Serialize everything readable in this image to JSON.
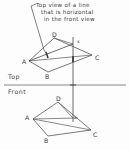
{
  "figure": {
    "title_annotation": {
      "lines": [
        "Top view of a line",
        "that is horizontal",
        "in the front view"
      ]
    },
    "view_labels": {
      "top": "Top",
      "front": "Front"
    },
    "top_view": {
      "vertices": [
        {
          "label": "A",
          "x": 29,
          "y": 61
        },
        {
          "label": "B",
          "x": 48,
          "y": 72
        },
        {
          "label": "C",
          "x": 92,
          "y": 55
        },
        {
          "label": "D",
          "x": 54,
          "y": 38
        }
      ],
      "point_x": {
        "label": "x",
        "x": 76,
        "y": 43
      },
      "horizontal_line_tick": {
        "x": 47,
        "y": 56
      }
    },
    "front_view": {
      "vertices": [
        {
          "label": "A",
          "x": 33,
          "y": 119
        },
        {
          "label": "B",
          "x": 48,
          "y": 136
        },
        {
          "label": "C",
          "x": 91,
          "y": 130
        },
        {
          "label": "D",
          "x": 58,
          "y": 102
        }
      ],
      "point_x": {
        "label": "x",
        "x": 74,
        "y": 118
      }
    },
    "fold_line": {
      "y": 85,
      "x_start": 4,
      "x_end": 126
    },
    "projector": {
      "x": 73,
      "y_top": 37,
      "y_bottom": 122
    },
    "colors": {
      "ink": "#3a3a3a",
      "line": "#575757",
      "paper": "#fdfdfd",
      "fold": "#6b6b6b"
    }
  }
}
